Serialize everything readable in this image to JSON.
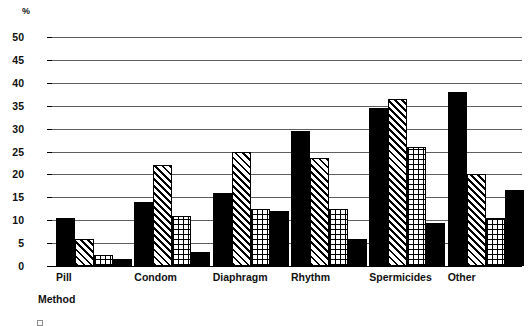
{
  "axis_unit_label": "%",
  "axis_title_x": "Method",
  "y_ticks": [
    "50",
    "45",
    "40",
    "35",
    "30",
    "25",
    "20",
    "15",
    "10",
    "5",
    "0"
  ],
  "colors": {
    "ink": "#000000",
    "gridline": "#5e5e5e",
    "background": "#ffffff"
  },
  "legend_fragment": {
    "visible_text": ""
  },
  "chart_data": {
    "type": "bar",
    "title": "",
    "subtitle": "",
    "xlabel": "Method",
    "ylabel": "%",
    "ylim": [
      0,
      50
    ],
    "ytick_step": 5,
    "grid": true,
    "legend_position": "bottom-clipped",
    "categories": [
      "Pill",
      "Condom",
      "Diaphragm",
      "Rhythm",
      "Spermicides",
      "Other"
    ],
    "series": [
      {
        "name": "Series 1",
        "pattern": "solid-black",
        "values": [
          10.5,
          14.0,
          16.0,
          29.5,
          34.5,
          38.0
        ]
      },
      {
        "name": "Series 2",
        "pattern": "diagonal-hatch",
        "values": [
          6.0,
          22.0,
          25.0,
          23.5,
          36.5,
          20.0
        ]
      },
      {
        "name": "Series 3",
        "pattern": "cross-hatch",
        "values": [
          2.5,
          11.0,
          12.5,
          12.5,
          26.0,
          10.5
        ]
      },
      {
        "name": "Series 4",
        "pattern": "solid-black",
        "values": [
          1.5,
          3.0,
          12.0,
          6.0,
          9.5,
          16.5
        ]
      }
    ]
  }
}
